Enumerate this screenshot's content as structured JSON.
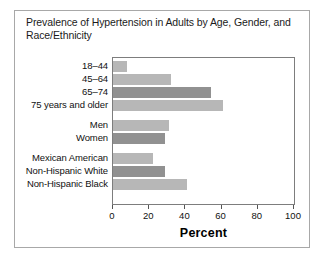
{
  "figure": {
    "title": "Prevalence of Hypertension in Adults by Age, Gender, and Race/Ethnicity",
    "border_color": "#a8a8a8",
    "background": "#ffffff"
  },
  "chart_data": {
    "type": "bar",
    "orientation": "horizontal",
    "title": "Prevalence of Hypertension in Adults by Age, Gender, and Race/Ethnicity",
    "xlabel": "Percent",
    "ylabel": "",
    "xlim": [
      0,
      100
    ],
    "xticks": [
      0,
      20,
      40,
      60,
      80,
      100
    ],
    "xtick_labels": [
      "0",
      "20",
      "40",
      "60",
      "80",
      "100"
    ],
    "grid": false,
    "legend": false,
    "categories": [
      "18–44",
      "45–64",
      "65–74",
      "75 years and older",
      "Men",
      "Women",
      "Mexican American",
      "Non-Hispanic White",
      "Non-Hispanic Black"
    ],
    "values": [
      8,
      32,
      54,
      61,
      31,
      29,
      22,
      29,
      41
    ],
    "bar_colors": [
      "#b7b7b7",
      "#b7b7b7",
      "#919191",
      "#b7b7b7",
      "#b7b7b7",
      "#919191",
      "#b7b7b7",
      "#919191",
      "#b7b7b7"
    ],
    "groups": [
      {
        "name": "Age",
        "category_indices": [
          0,
          1,
          2,
          3
        ]
      },
      {
        "name": "Gender",
        "category_indices": [
          4,
          5
        ]
      },
      {
        "name": "Race/Ethnicity",
        "category_indices": [
          6,
          7,
          8
        ]
      }
    ]
  }
}
